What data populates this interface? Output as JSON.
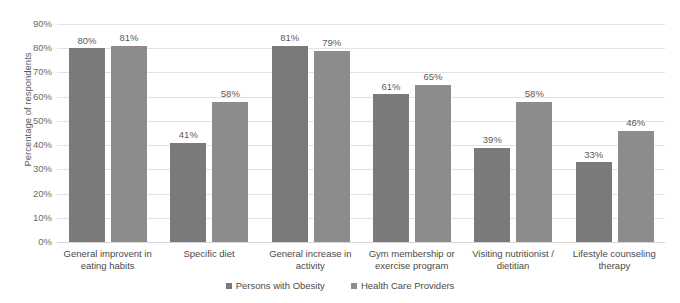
{
  "chart_data": {
    "type": "bar",
    "title": "",
    "subtitle": "",
    "xlabel": "",
    "ylabel": "Percentage of respondents",
    "ylim": [
      0,
      90
    ],
    "ytick_labels": [
      "90%",
      "80%",
      "70%",
      "60%",
      "50%",
      "40%",
      "30%",
      "20%",
      "10%",
      "0%"
    ],
    "ytick_values": [
      90,
      80,
      70,
      60,
      50,
      40,
      30,
      20,
      10,
      0
    ],
    "grid": true,
    "legend_position": "bottom",
    "categories": [
      "General improvent in eating habits",
      "Specific diet",
      "General increase in activity",
      "Gym membership or exercise program",
      "Visiting nutritionist / dietitian",
      "Lifestyle counseling therapy"
    ],
    "category_lines": [
      [
        "General improvent in",
        "eating habits"
      ],
      [
        "Specific diet",
        ""
      ],
      [
        "General increase in",
        "activity"
      ],
      [
        "Gym membership or",
        "exercise program"
      ],
      [
        "Visiting nutritionist /",
        "dietitian"
      ],
      [
        "Lifestyle counseling",
        "therapy"
      ]
    ],
    "series": [
      {
        "name": "Persons with Obesity",
        "color": "#7a7a7a",
        "values": [
          80,
          41,
          81,
          61,
          39,
          33
        ],
        "labels": [
          "80%",
          "41%",
          "81%",
          "61%",
          "39%",
          "33%"
        ]
      },
      {
        "name": "Health Care Providers",
        "color": "#8c8c8c",
        "values": [
          81,
          58,
          79,
          65,
          58,
          46
        ],
        "labels": [
          "81%",
          "58%",
          "79%",
          "65%",
          "58%",
          "46%"
        ]
      }
    ]
  },
  "legend": {
    "items": [
      {
        "label": "Persons with Obesity",
        "color": "#7a7a7a"
      },
      {
        "label": "Health Care Providers",
        "color": "#8c8c8c"
      }
    ]
  }
}
